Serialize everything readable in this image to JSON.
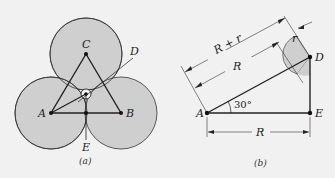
{
  "figure_a": {
    "caption": "(a)",
    "labels": {
      "A": "A",
      "B": "B",
      "C": "C",
      "D": "D",
      "E": "E"
    }
  },
  "figure_b": {
    "caption": "(b)",
    "labels": {
      "A": "A",
      "D": "D",
      "E": "E"
    },
    "dimensions": {
      "r_plus_R": "R + r",
      "R_diag": "R",
      "r": "r",
      "R_base": "R"
    },
    "angle": "30°"
  },
  "colors": {
    "background": "#f1f1f1",
    "circle_fill": "#cfcfcf",
    "stroke": "#222222"
  }
}
